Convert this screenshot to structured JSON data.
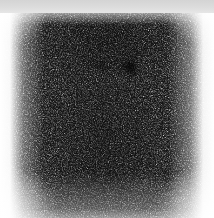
{
  "viewer": {
    "width": 214,
    "height": 218,
    "background_color": "#ffffff"
  },
  "header_strip": {
    "name": "header-strip",
    "color": "#d9d9d9",
    "height_px": 13
  },
  "scan": {
    "modality": "planar-scintigraphy",
    "colormap": "grayscale-inverted",
    "field": {
      "left_px": 0,
      "top_px": 13,
      "width_px": 214,
      "height_px": 205
    },
    "background_color": "#ffffff",
    "noise": {
      "type": "poisson-counting-speckle",
      "base_frequency": 0.85,
      "opacity": 0.92
    },
    "body_outline": {
      "label": "diffuse-soft-tissue-uptake",
      "center_x_px": 105,
      "center_y_px": 120
    },
    "foci": [
      {
        "id": "focus-primary",
        "label": "intense-focal-uptake",
        "center_x_px": 130,
        "center_y_px": 67,
        "radius_x_px": 12,
        "radius_y_px": 14,
        "peak_color": "#141414",
        "relative_intensity": 1.0
      },
      {
        "id": "focus-secondary",
        "label": "faint-focal-uptake",
        "center_x_px": 102,
        "center_y_px": 66,
        "radius_x_px": 11,
        "radius_y_px": 10,
        "peak_color": "#555555",
        "relative_intensity": 0.55
      }
    ]
  },
  "chart_data": {
    "type": "heatmap",
    "title": "",
    "xlabel": "",
    "ylabel": "",
    "colormap": "grayscale-inverted",
    "value_meaning": "radiotracer counts per pixel (darker = higher counts)",
    "xlim": [
      0,
      214
    ],
    "ylim": [
      13,
      218
    ],
    "grid": false,
    "legend": "none",
    "annotations": [
      {
        "text": "intense-focal-uptake",
        "x": 130,
        "y": 67
      },
      {
        "text": "faint-focal-uptake",
        "x": 102,
        "y": 66
      }
    ],
    "features": [
      {
        "name": "diffuse-background-uptake",
        "x": 105,
        "y": 120,
        "value": 0.35
      },
      {
        "name": "upper-band-uptake",
        "x": 107,
        "y": 43,
        "value": 0.5
      },
      {
        "name": "faint-focal-uptake",
        "x": 102,
        "y": 66,
        "value": 0.62
      },
      {
        "name": "intense-focal-uptake",
        "x": 130,
        "y": 67,
        "value": 0.92
      },
      {
        "name": "lower-field-uptake",
        "x": 104,
        "y": 188,
        "value": 0.28
      },
      {
        "name": "left-edge-falloff",
        "x": 10,
        "y": 120,
        "value": 0.04
      },
      {
        "name": "right-edge-falloff",
        "x": 204,
        "y": 120,
        "value": 0.04
      }
    ]
  }
}
